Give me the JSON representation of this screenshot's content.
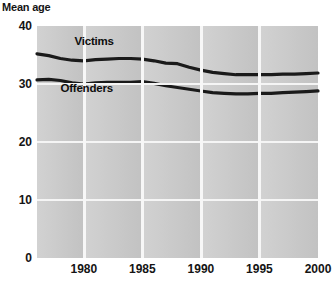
{
  "chart_data": {
    "type": "line",
    "title": "Mean age",
    "xlabel": "",
    "ylabel": "Mean age",
    "xlim": [
      1976,
      2000
    ],
    "ylim": [
      0,
      40
    ],
    "grid": true,
    "legend_position": "inline-annotation",
    "ytick_labels": [
      "40",
      "30",
      "20",
      "10",
      "0"
    ],
    "ytick_values": [
      40,
      30,
      20,
      10,
      0
    ],
    "xtick_labels": [
      "1980",
      "1985",
      "1990",
      "1995",
      "2000"
    ],
    "xtick_values": [
      1980,
      1985,
      1990,
      1995,
      2000
    ],
    "x": [
      1976,
      1977,
      1978,
      1979,
      1980,
      1981,
      1982,
      1983,
      1984,
      1985,
      1986,
      1987,
      1988,
      1989,
      1990,
      1991,
      1992,
      1993,
      1994,
      1995,
      1996,
      1997,
      1998,
      1999,
      2000
    ],
    "series": [
      {
        "name": "Victims",
        "color": "#1a1a1a",
        "values": [
          35.2,
          34.9,
          34.4,
          34.1,
          34.0,
          34.2,
          34.3,
          34.4,
          34.4,
          34.3,
          34.0,
          33.6,
          33.5,
          32.9,
          32.4,
          32.0,
          31.8,
          31.6,
          31.6,
          31.6,
          31.6,
          31.7,
          31.7,
          31.8,
          31.9
        ]
      },
      {
        "name": "Offenders",
        "color": "#1a1a1a",
        "values": [
          30.7,
          30.8,
          30.6,
          30.2,
          30.0,
          30.2,
          30.3,
          30.3,
          30.3,
          30.4,
          30.1,
          29.7,
          29.4,
          29.1,
          28.8,
          28.5,
          28.4,
          28.3,
          28.3,
          28.4,
          28.4,
          28.5,
          28.6,
          28.7,
          28.8
        ]
      }
    ],
    "annotations": [
      {
        "text": "Victims",
        "x": 1979.2,
        "y": 37.3
      },
      {
        "text": "Offenders",
        "x": 1978.0,
        "y": 29.1
      }
    ]
  },
  "style": {
    "plot_background_light": "#d2d2d2",
    "plot_background_dark": "#c2c2c2",
    "gridline_color": "#f5f5f5",
    "line_color": "#1a1a1a",
    "text_color": "#141414",
    "page_background": "#ffffff"
  }
}
